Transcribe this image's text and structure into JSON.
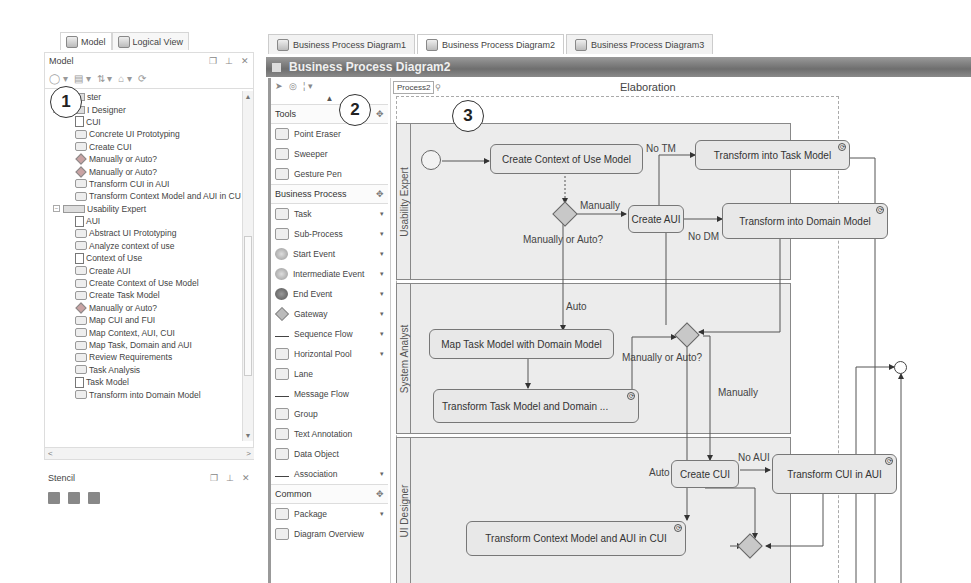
{
  "left_panel": {
    "tabs": [
      {
        "label": "Model",
        "active": true
      },
      {
        "label": "Logical View",
        "active": false
      }
    ],
    "model_panel": {
      "title": "Model",
      "controls": [
        "restore-icon",
        "pin-icon",
        "close-icon"
      ],
      "toolbar_icons": [
        "new-element-icon",
        "diagram-icon",
        "sort-icon",
        "up-icon",
        "refresh-icon"
      ],
      "tree": [
        {
          "label": "ster",
          "type": "lane",
          "level": 0
        },
        {
          "label": "I Designer",
          "type": "lane",
          "level": 0
        },
        {
          "label": "CUI",
          "type": "doc",
          "level": 1
        },
        {
          "label": "Concrete UI Prototyping",
          "type": "task",
          "level": 1
        },
        {
          "label": "Create CUI",
          "type": "task",
          "level": 1
        },
        {
          "label": "Manually or Auto?",
          "type": "gateway",
          "level": 1
        },
        {
          "label": "Manually or Auto?",
          "type": "gateway",
          "level": 1
        },
        {
          "label": "Transform CUI in AUI",
          "type": "task",
          "level": 1
        },
        {
          "label": "Transform Context Model and AUI in CU",
          "type": "task",
          "level": 1
        },
        {
          "label": "Usability Expert",
          "type": "lane",
          "level": 0
        },
        {
          "label": "AUI",
          "type": "doc",
          "level": 1
        },
        {
          "label": "Abstract UI Prototyping",
          "type": "task",
          "level": 1
        },
        {
          "label": "Analyze context of use",
          "type": "task",
          "level": 1
        },
        {
          "label": "Context of Use",
          "type": "doc",
          "level": 1
        },
        {
          "label": "Create AUI",
          "type": "task",
          "level": 1
        },
        {
          "label": "Create Context of Use Model",
          "type": "task",
          "level": 1
        },
        {
          "label": "Create Task Model",
          "type": "task",
          "level": 1
        },
        {
          "label": "Manually or Auto?",
          "type": "gateway",
          "level": 1
        },
        {
          "label": "Map CUI and FUI",
          "type": "task",
          "level": 1
        },
        {
          "label": "Map Context, AUI, CUI",
          "type": "task",
          "level": 1
        },
        {
          "label": "Map Task, Domain and AUI",
          "type": "task",
          "level": 1
        },
        {
          "label": "Review Requirements",
          "type": "task",
          "level": 1
        },
        {
          "label": "Task Analysis",
          "type": "task",
          "level": 1
        },
        {
          "label": "Task Model",
          "type": "doc",
          "level": 1
        },
        {
          "label": "Transform into Domain Model",
          "type": "task",
          "level": 1
        }
      ]
    },
    "stencil_panel": {
      "title": "Stencil",
      "tool_icons": [
        "open-stencil-icon",
        "save-stencil-icon",
        "stencil-grid-icon"
      ]
    }
  },
  "callouts": [
    "1",
    "2",
    "3"
  ],
  "doc_tabs": [
    {
      "label": "Business Process Diagram1",
      "active": false
    },
    {
      "label": "Business Process Diagram2",
      "active": true
    },
    {
      "label": "Business Process Diagram3",
      "active": false
    }
  ],
  "diagram_title": "Business Process Diagram2",
  "palette": {
    "top_icons": [
      "select-icon",
      "lasso-icon",
      "more-icon"
    ],
    "groups": [
      {
        "label": "Tools",
        "items": [
          {
            "label": "Point Eraser",
            "icon": "eraser",
            "dropdown": false
          },
          {
            "label": "Sweeper",
            "icon": "sweeper",
            "dropdown": false
          },
          {
            "label": "Gesture Pen",
            "icon": "pen",
            "dropdown": false
          }
        ]
      },
      {
        "label": "Business Process",
        "items": [
          {
            "label": "Task",
            "icon": "box",
            "dropdown": true
          },
          {
            "label": "Sub-Process",
            "icon": "box",
            "dropdown": true
          },
          {
            "label": "Start Event",
            "icon": "circle",
            "dropdown": true
          },
          {
            "label": "Intermediate Event",
            "icon": "circle",
            "dropdown": true
          },
          {
            "label": "End Event",
            "icon": "circle-dark",
            "dropdown": true
          },
          {
            "label": "Gateway",
            "icon": "diamond",
            "dropdown": true
          },
          {
            "label": "Sequence Flow",
            "icon": "line",
            "dropdown": true
          },
          {
            "label": "Horizontal Pool",
            "icon": "box",
            "dropdown": true
          },
          {
            "label": "Lane",
            "icon": "box",
            "dropdown": false
          },
          {
            "label": "Message Flow",
            "icon": "line",
            "dropdown": false
          },
          {
            "label": "Group",
            "icon": "box",
            "dropdown": false
          },
          {
            "label": "Text Annotation",
            "icon": "box",
            "dropdown": false
          },
          {
            "label": "Data Object",
            "icon": "box",
            "dropdown": false
          },
          {
            "label": "Association",
            "icon": "line",
            "dropdown": true
          }
        ]
      },
      {
        "label": "Common",
        "items": [
          {
            "label": "Package",
            "icon": "box",
            "dropdown": true
          },
          {
            "label": "Diagram Overview",
            "icon": "box",
            "dropdown": false
          }
        ]
      }
    ]
  },
  "canvas": {
    "breadcrumb": "Process2",
    "pool_title": "Elaboration",
    "lanes": [
      "Usability Expert",
      "System Analyst",
      "UI Designer"
    ],
    "tasks": {
      "create_context": "Create Context of Use Model",
      "transform_task": "Transform into Task Model",
      "create_aui": "Create AUI",
      "transform_domain": "Transform into Domain Model",
      "map_task": "Map Task Model with Domain Model",
      "transform_task_domain": "Transform Task Model and Domain ...",
      "create_cui": "Create CUI",
      "transform_cui": "Transform CUI in AUI",
      "transform_context_aui": "Transform Context Model and AUI in CUI"
    },
    "labels": {
      "no_tm": "No TM",
      "manually1": "Manually",
      "gw1": "Manually or Auto?",
      "no_dm": "No DM",
      "auto1": "Auto",
      "gw2": "Manually or Auto?",
      "manually2": "Manually",
      "no_aui": "No AUI",
      "auto2": "Auto"
    }
  }
}
